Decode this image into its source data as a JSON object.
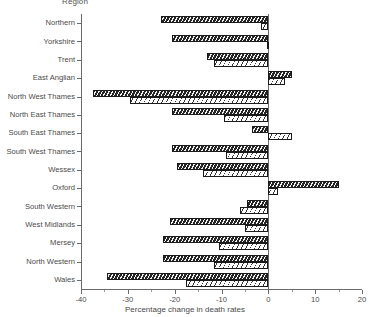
{
  "axes": {
    "y_title": "Region",
    "x_title": "Percentage change in death rates",
    "x_ticks": [
      "-40",
      "-30",
      "-20",
      "-10",
      "0",
      "10",
      "20"
    ]
  },
  "chart_data": {
    "type": "bar",
    "orientation": "horizontal",
    "title": "",
    "xlabel": "Percentage change in death rates",
    "ylabel": "Region",
    "xlim": [
      -40,
      20
    ],
    "xticks": [
      -40,
      -30,
      -20,
      -10,
      0,
      10,
      20
    ],
    "grid": false,
    "legend": "none",
    "categories": [
      "Northern",
      "Yorkshire",
      "Trent",
      "East Anglian",
      "North West Thames",
      "North East Thames",
      "South East Thames",
      "South West Thames",
      "Wessex",
      "Oxford",
      "South Western",
      "West Midlands",
      "Mersey",
      "North Western",
      "Wales"
    ],
    "series": [
      {
        "name": "series-dark",
        "style": "dark-hatched",
        "values": [
          -23.0,
          -20.5,
          -13.0,
          5.0,
          -37.5,
          -20.5,
          -3.5,
          -20.5,
          -19.5,
          15.0,
          -4.5,
          -21.0,
          -22.5,
          -22.5,
          -34.5
        ]
      },
      {
        "name": "series-light",
        "style": "light-hatched",
        "values": [
          -1.5,
          -0.2,
          -11.5,
          3.5,
          -29.5,
          -9.5,
          5.0,
          -9.0,
          -14.0,
          2.0,
          -6.0,
          -5.0,
          -10.5,
          -11.5,
          -17.5
        ]
      }
    ]
  }
}
